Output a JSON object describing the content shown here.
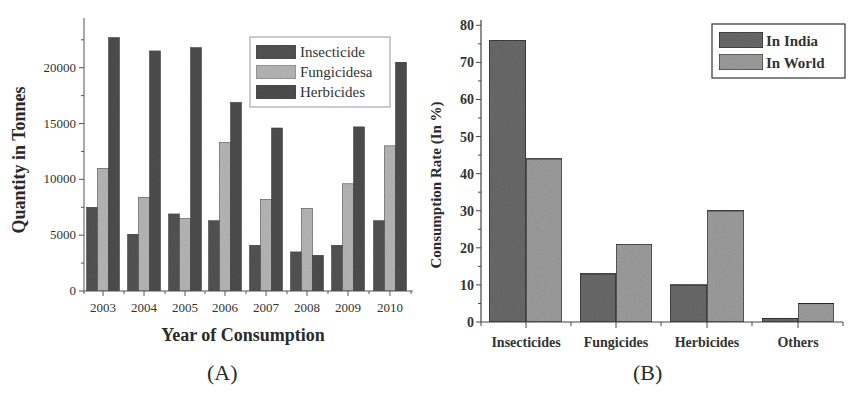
{
  "chart_data": [
    {
      "id": "A",
      "type": "bar",
      "panel_label": "(A)",
      "title": "",
      "xlabel": "Year of Consumption",
      "ylabel": "Quantity in Tonnes",
      "categories": [
        "2003",
        "2004",
        "2005",
        "2006",
        "2007",
        "2008",
        "2009",
        "2010"
      ],
      "series": [
        {
          "name": "Insecticide",
          "color": "#555555",
          "values": [
            7500,
            5100,
            6900,
            6300,
            4100,
            3500,
            4100,
            6300
          ]
        },
        {
          "name": "Fungicidesa",
          "color": "#b8b8b8",
          "values": [
            11000,
            8400,
            6500,
            13300,
            8200,
            7400,
            9600,
            13000
          ]
        },
        {
          "name": "Herbicides",
          "color": "#505050",
          "values": [
            22700,
            21500,
            21800,
            16900,
            14600,
            3200,
            14700,
            20500
          ]
        }
      ],
      "yticks": [
        0,
        5000,
        10000,
        15000,
        20000
      ],
      "ylim": [
        0,
        24000
      ],
      "grid": false,
      "legend_position": "upper right"
    },
    {
      "id": "B",
      "type": "bar",
      "panel_label": "(B)",
      "title": "",
      "xlabel": "",
      "ylabel": "Consumption Rate (In %)",
      "categories": [
        "Insecticides",
        "Fungicides",
        "Herbicides",
        "Others"
      ],
      "series": [
        {
          "name": "In India",
          "color": "#6a6a6a",
          "values": [
            76,
            13,
            10,
            1
          ]
        },
        {
          "name": "In World",
          "color": "#9e9e9e",
          "values": [
            44,
            21,
            30,
            5
          ]
        }
      ],
      "yticks": [
        0,
        10,
        20,
        30,
        40,
        50,
        60,
        70,
        80
      ],
      "ylim": [
        0,
        80
      ],
      "grid": false,
      "legend_position": "upper right"
    }
  ]
}
